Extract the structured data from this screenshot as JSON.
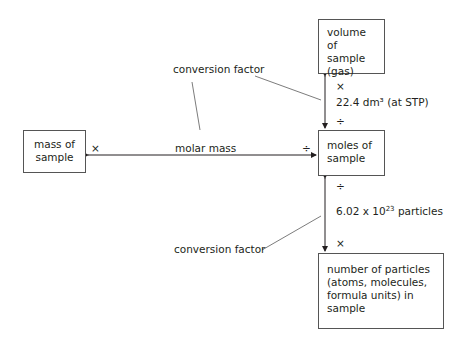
{
  "diagram": {
    "boxes": {
      "volume": "volume of sample (gas)",
      "moles": "moles of sample",
      "mass": "mass of sample",
      "particles": "number of particles (atoms, molecules, formula units) in sample"
    },
    "labels": {
      "conversion_factor_top": "conversion factor",
      "conversion_factor_bottom": "conversion factor",
      "molar_mass": "molar mass",
      "volume_factor": "22.4 dm³ (at STP)",
      "particles_factor_base": "6.02 x 10",
      "particles_factor_exp": "23",
      "particles_factor_unit": " particles",
      "op_mass_multiply": "×",
      "op_moles_divide_left": "÷",
      "op_volume_multiply": "×",
      "op_moles_divide_top": "÷",
      "op_moles_divide_bottom": "÷",
      "op_particles_multiply": "×"
    },
    "colors": {
      "line": "#231f20",
      "box_border": "#555555"
    }
  }
}
